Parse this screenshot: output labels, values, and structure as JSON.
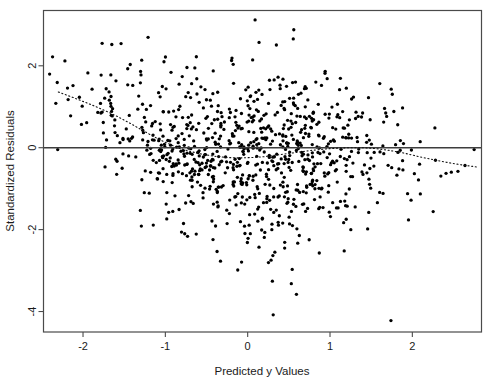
{
  "chart_data": {
    "type": "scatter",
    "title": "",
    "xlabel": "Predicted y Values",
    "ylabel": "Standardized Residuals",
    "xlim": [
      -2.48,
      2.84
    ],
    "ylim": [
      -4.5,
      3.35
    ],
    "xticks": [
      -2,
      -1,
      0,
      1,
      2
    ],
    "xticklabels": [
      "-2",
      "-1",
      "0",
      "1",
      "2"
    ],
    "yticks": [
      2,
      0,
      -2,
      -4
    ],
    "yticklabels": [
      "2",
      "0",
      "-2",
      "-4"
    ],
    "grid": false,
    "legend": false,
    "frame": true,
    "marker": "filled-circle",
    "marker_size_px": 2.6,
    "marker_color": "#000000",
    "reference_line": {
      "name": "zero-line",
      "type": "horizontal",
      "y": 0,
      "style": "solid",
      "color": "#3d3d3d",
      "width_px": 1.6
    },
    "trend_line": {
      "name": "lowess-smoother",
      "style": "dotted",
      "color": "#111111",
      "width_px": 1.1,
      "points": [
        [
          -2.3,
          1.36
        ],
        [
          -2.1,
          1.21
        ],
        [
          -1.9,
          1.05
        ],
        [
          -1.75,
          0.92
        ],
        [
          -1.6,
          0.78
        ],
        [
          -1.45,
          0.62
        ],
        [
          -1.3,
          0.45
        ],
        [
          -1.15,
          0.28
        ],
        [
          -1.0,
          0.13
        ],
        [
          -0.85,
          0.0
        ],
        [
          -0.7,
          -0.09
        ],
        [
          -0.55,
          -0.16
        ],
        [
          -0.4,
          -0.21
        ],
        [
          -0.25,
          -0.24
        ],
        [
          -0.1,
          -0.25
        ],
        [
          0.05,
          -0.24
        ],
        [
          0.2,
          -0.22
        ],
        [
          0.35,
          -0.18
        ],
        [
          0.5,
          -0.14
        ],
        [
          0.65,
          -0.1
        ],
        [
          0.8,
          -0.06
        ],
        [
          0.95,
          -0.03
        ],
        [
          1.1,
          -0.01
        ],
        [
          1.25,
          0.0
        ],
        [
          1.4,
          0.0
        ],
        [
          1.55,
          -0.02
        ],
        [
          1.7,
          -0.06
        ],
        [
          1.85,
          -0.11
        ],
        [
          2.0,
          -0.18
        ],
        [
          2.15,
          -0.25
        ],
        [
          2.3,
          -0.31
        ],
        [
          2.45,
          -0.37
        ],
        [
          2.6,
          -0.42
        ],
        [
          2.78,
          -0.47
        ]
      ]
    },
    "n_points": 905,
    "point_distribution": {
      "description": "Dense negatively-sloped funnel cloud; residual spread widest near x between -1.2 and 0.8, narrowing at both ends",
      "x_mean": 0.05,
      "x_sd": 0.95,
      "y_mean": -0.18,
      "y_sd": 0.88
    },
    "outliers": [
      [
        0.31,
        -4.08
      ],
      [
        1.74,
        -4.22
      ],
      [
        0.3,
        -3.26
      ],
      [
        0.53,
        -3.32
      ],
      [
        -0.33,
        -2.77
      ],
      [
        0.33,
        -2.55
      ],
      [
        0.09,
        3.12
      ],
      [
        0.56,
        2.88
      ],
      [
        -1.65,
        2.52
      ],
      [
        -2.37,
        2.22
      ],
      [
        -2.22,
        2.12
      ]
    ]
  },
  "axes": {
    "x_axis_label": "Predicted y Values",
    "y_axis_label": "Standardized Residuals",
    "x_tick_labels": [
      "-2",
      "-1",
      "0",
      "1",
      "2"
    ],
    "y_tick_labels": [
      "2",
      "0",
      "-2",
      "-4"
    ]
  },
  "colors": {
    "background": "#ffffff",
    "frame": "#4a4a4a",
    "point": "#000000",
    "zero_line": "#3d3d3d",
    "trend_line": "#111111",
    "text": "#1a1a1a"
  }
}
